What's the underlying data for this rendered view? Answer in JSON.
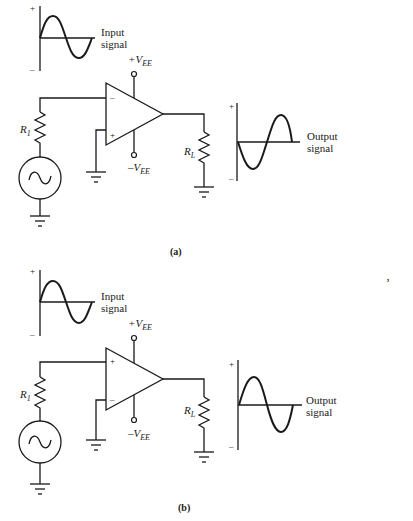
{
  "figure": {
    "panels": [
      {
        "caption": "(a)",
        "input_signal": {
          "label_line1": "Input",
          "label_line2": "signal",
          "plus": "+",
          "minus": "–"
        },
        "output_signal": {
          "label_line1": "Output",
          "label_line2": "signal",
          "plus": "+",
          "minus": "–",
          "phase": "inverted"
        },
        "opamp": {
          "top_input": "–",
          "bottom_input": "+",
          "supply_pos": "+V",
          "supply_pos_sub": "EE",
          "supply_neg": "–V",
          "supply_neg_sub": "EE"
        },
        "source_resistor": {
          "label": "R",
          "sub": "1"
        },
        "load_resistor": {
          "label": "R",
          "sub": "L"
        }
      },
      {
        "caption": "(b)",
        "input_signal": {
          "label_line1": "Input",
          "label_line2": "signal",
          "plus": "+",
          "minus": "–"
        },
        "output_signal": {
          "label_line1": "Output",
          "label_line2": "signal",
          "plus": "+",
          "minus": "–",
          "phase": "in-phase"
        },
        "opamp": {
          "top_input": "+",
          "bottom_input": "–",
          "supply_pos": "+V",
          "supply_pos_sub": "EE",
          "supply_neg": "–V",
          "supply_neg_sub": "EE"
        },
        "source_resistor": {
          "label": "R",
          "sub": "1"
        },
        "load_resistor": {
          "label": "R",
          "sub": "L"
        }
      }
    ],
    "stray_mark": "‚"
  }
}
